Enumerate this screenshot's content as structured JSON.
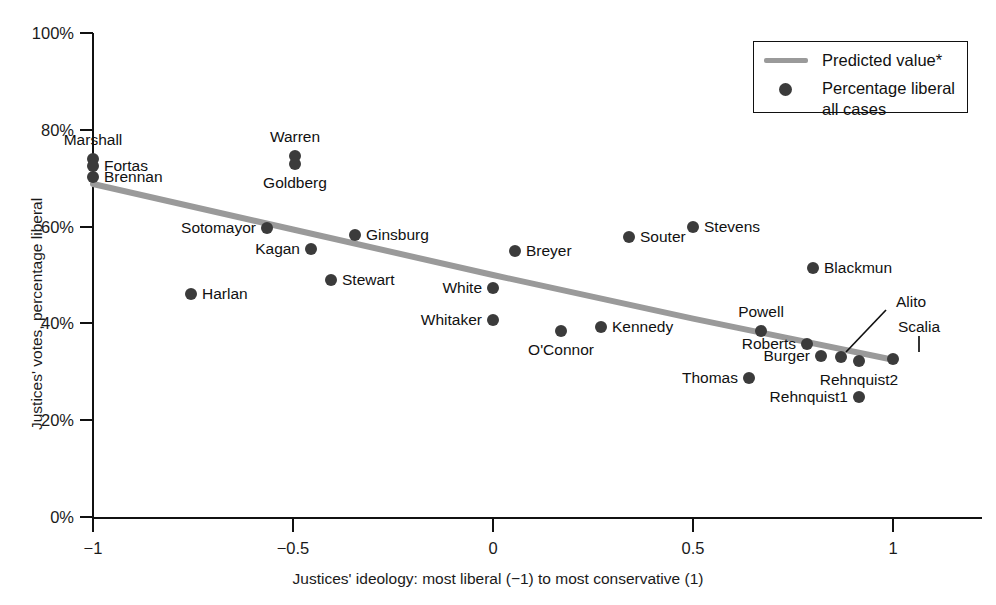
{
  "chart_data": {
    "type": "scatter",
    "title": "",
    "xlabel": "Justices' ideology: most liberal (−1) to most conservative (1)",
    "ylabel": "Justices' votes, percentage liberal",
    "xlim": [
      -1.08,
      1.08
    ],
    "ylim": [
      0,
      100
    ],
    "xticks": [
      -1,
      -0.5,
      0,
      0.5,
      1
    ],
    "xticklabels": [
      "−1",
      "−0.5",
      "0",
      "0.5",
      "1"
    ],
    "yticks": [
      0,
      20,
      40,
      60,
      80,
      100
    ],
    "yticklabels": [
      "0%",
      "20%",
      "40%",
      "60%",
      "80%",
      "100%"
    ],
    "grid": false,
    "legend_position": "top-right",
    "series": [
      {
        "name": "Percentage liberal all cases",
        "marker": "circle",
        "color": "#3b3b3b",
        "points": [
          {
            "label": "Marshall",
            "x": -1.0,
            "y": 74.0,
            "label_pos": "above"
          },
          {
            "label": "Fortas",
            "x": -1.0,
            "y": 72.6,
            "label_pos": "right"
          },
          {
            "label": "Brennan",
            "x": -1.0,
            "y": 70.2,
            "label_pos": "right"
          },
          {
            "label": "Warren",
            "x": -0.495,
            "y": 74.5,
            "label_pos": "above"
          },
          {
            "label": "Goldberg",
            "x": -0.495,
            "y": 73.0,
            "label_pos": "below"
          },
          {
            "label": "Sotomayor",
            "x": -0.565,
            "y": 59.8,
            "label_pos": "left"
          },
          {
            "label": "Kagan",
            "x": -0.455,
            "y": 55.4,
            "label_pos": "left"
          },
          {
            "label": "Ginsburg",
            "x": -0.345,
            "y": 58.2,
            "label_pos": "right"
          },
          {
            "label": "Stewart",
            "x": -0.405,
            "y": 49.0,
            "label_pos": "right"
          },
          {
            "label": "Harlan",
            "x": -0.755,
            "y": 46.1,
            "label_pos": "right"
          },
          {
            "label": "Breyer",
            "x": 0.055,
            "y": 54.9,
            "label_pos": "right"
          },
          {
            "label": "White",
            "x": 0.0,
            "y": 47.3,
            "label_pos": "left"
          },
          {
            "label": "Whitaker",
            "x": 0.0,
            "y": 40.8,
            "label_pos": "left"
          },
          {
            "label": "O'Connor",
            "x": 0.17,
            "y": 38.4,
            "label_pos": "below"
          },
          {
            "label": "Kennedy",
            "x": 0.27,
            "y": 39.3,
            "label_pos": "right"
          },
          {
            "label": "Souter",
            "x": 0.34,
            "y": 57.8,
            "label_pos": "right"
          },
          {
            "label": "Stevens",
            "x": 0.5,
            "y": 60.0,
            "label_pos": "right"
          },
          {
            "label": "Blackmun",
            "x": 0.8,
            "y": 51.5,
            "label_pos": "right"
          },
          {
            "label": "Powell",
            "x": 0.67,
            "y": 38.4,
            "label_pos": "above"
          },
          {
            "label": "Roberts",
            "x": 0.785,
            "y": 35.7,
            "label_pos": "left"
          },
          {
            "label": "Burger",
            "x": 0.82,
            "y": 33.3,
            "label_pos": "left"
          },
          {
            "label": "Alito",
            "x": 0.87,
            "y": 33.1,
            "label_pos": "leader"
          },
          {
            "label": "Thomas",
            "x": 0.64,
            "y": 28.7,
            "label_pos": "left"
          },
          {
            "label": "Rehnquist2",
            "x": 0.915,
            "y": 32.2,
            "label_pos": "below"
          },
          {
            "label": "Rehnquist1",
            "x": 0.915,
            "y": 24.8,
            "label_pos": "left"
          },
          {
            "label": "Scalia",
            "x": 1.0,
            "y": 32.6,
            "label_pos": "leader"
          }
        ]
      }
    ],
    "trendline": {
      "name": "Predicted value*",
      "color": "#9a9a9a",
      "points": [
        {
          "x": -1.0,
          "y": 68.8
        },
        {
          "x": -0.5,
          "y": 59.4
        },
        {
          "x": 0.0,
          "y": 50.0
        },
        {
          "x": 0.5,
          "y": 41.0
        },
        {
          "x": 1.0,
          "y": 32.5
        }
      ]
    }
  },
  "legend": {
    "entries": [
      {
        "type": "line",
        "label": "Predicted value*"
      },
      {
        "type": "dot",
        "label": "Percentage liberal\nall cases"
      }
    ],
    "line_label": "Predicted value*",
    "dot_label_line1": "Percentage liberal",
    "dot_label_line2": "all cases"
  },
  "axes": {
    "x_title": "Justices' ideology: most liberal (−1) to most conservative (1)",
    "y_title": "Justices' votes, percentage liberal"
  },
  "colors": {
    "dot": "#3b3b3b",
    "trendline": "#9a9a9a",
    "axis": "#111111",
    "text": "#1a1a1a",
    "background": "#ffffff"
  }
}
